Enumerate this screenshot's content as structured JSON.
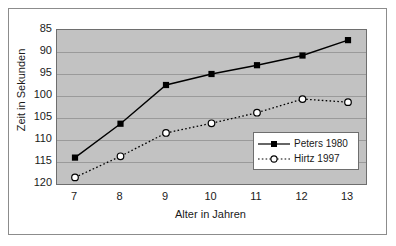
{
  "chart_data": {
    "type": "line",
    "title": "",
    "xlabel": "Alter in Jahren",
    "ylabel": "Zeit in Sekunden",
    "x": [
      7,
      8,
      9,
      10,
      11,
      12,
      13
    ],
    "xticklabels": [
      "7",
      "8",
      "9",
      "10",
      "11",
      "12",
      "13"
    ],
    "yticklabels": [
      "85",
      "90",
      "95",
      "100",
      "105",
      "110",
      "115",
      "120"
    ],
    "yticks": [
      85,
      90,
      95,
      100,
      105,
      110,
      115,
      120
    ],
    "ylim": [
      85,
      120
    ],
    "y_axis_inverted": true,
    "xlim": [
      7,
      13
    ],
    "grid": true,
    "legend_position": "lower right",
    "plot_background": "#c2c2c2",
    "figure_background": "#ffffff",
    "series": [
      {
        "name": "Peters 1980",
        "values": [
          114.0,
          106.3,
          97.5,
          95.0,
          93.0,
          90.8,
          87.3
        ],
        "line_style": "solid",
        "marker": "filled-square",
        "color": "#000000"
      },
      {
        "name": "Hirtz 1997",
        "values": [
          118.5,
          113.7,
          108.4,
          106.2,
          103.8,
          100.7,
          101.4
        ],
        "line_style": "dotted",
        "marker": "open-circle",
        "color": "#000000"
      }
    ]
  },
  "legend": {
    "items": [
      {
        "label": "Peters 1980"
      },
      {
        "label": "Hirtz 1997"
      }
    ]
  }
}
